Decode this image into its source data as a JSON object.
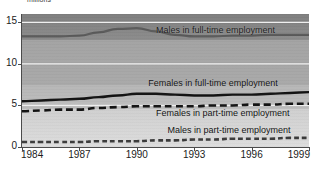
{
  "chart_data": {
    "type": "line",
    "title": "",
    "ylabel": "millions",
    "xlabel": "",
    "xlim": [
      1984,
      1999
    ],
    "ylim": [
      0,
      16
    ],
    "grid": true,
    "legend_position": "inline-annotations",
    "y_ticks": [
      "0",
      "5",
      "10",
      "15"
    ],
    "y_tick_values": [
      0,
      5,
      10,
      15
    ],
    "x_ticks": [
      "1984",
      "1987",
      "1990",
      "1993",
      "1996",
      "1999"
    ],
    "x_tick_values": [
      1984,
      1987,
      1990,
      1993,
      1996,
      1999
    ],
    "x": [
      1984,
      1985,
      1986,
      1987,
      1988,
      1989,
      1990,
      1991,
      1992,
      1993,
      1994,
      1995,
      1996,
      1997,
      1998,
      1999
    ],
    "series": [
      {
        "name": "Males in full-time employment",
        "style": "solid",
        "color": "#5a5a5a",
        "values": [
          13.3,
          13.3,
          13.3,
          13.4,
          13.8,
          14.2,
          14.3,
          13.9,
          13.5,
          13.3,
          13.3,
          13.4,
          13.4,
          13.5,
          13.5,
          13.5
        ]
      },
      {
        "name": "Females in full-time employment",
        "style": "solid",
        "color": "#121212",
        "values": [
          5.5,
          5.6,
          5.7,
          5.8,
          6.0,
          6.2,
          6.4,
          6.4,
          6.3,
          6.2,
          6.2,
          6.3,
          6.3,
          6.4,
          6.5,
          6.6
        ]
      },
      {
        "name": "Females in part-time employment",
        "style": "dashed",
        "color": "#121212",
        "values": [
          4.3,
          4.4,
          4.5,
          4.5,
          4.7,
          4.8,
          4.9,
          4.9,
          4.9,
          4.9,
          5.0,
          5.0,
          5.1,
          5.1,
          5.2,
          5.2
        ]
      },
      {
        "name": "Males in part-time employment",
        "style": "dashed",
        "color": "#3a3a3a",
        "values": [
          0.6,
          0.6,
          0.6,
          0.6,
          0.7,
          0.7,
          0.7,
          0.8,
          0.8,
          0.9,
          0.9,
          1.0,
          1.0,
          1.0,
          1.1,
          1.1
        ]
      }
    ],
    "annotations": [
      {
        "text": "Males in full-time employment",
        "x": 1991.0,
        "y": 14.0
      },
      {
        "text": "Females in full-time employment",
        "x": 1990.6,
        "y": 7.6
      },
      {
        "text": "Females in part-time employment",
        "x": 1991.0,
        "y": 4.0
      },
      {
        "text": "Males in part-time employment",
        "x": 1991.6,
        "y": 1.9
      }
    ]
  }
}
